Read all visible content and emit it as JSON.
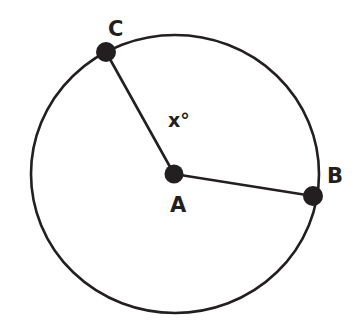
{
  "figure": {
    "background_color": "#ffffff",
    "stroke_color": "#231f20",
    "canvas": {
      "width": 355,
      "height": 329
    }
  },
  "circle": {
    "name": "circle-outline",
    "center_x": 175,
    "center_y": 174,
    "radius_x": 144,
    "radius_y": 139,
    "stroke_width": 2.6,
    "fill": "none"
  },
  "points": [
    {
      "id": "A",
      "label": "A",
      "role": "center",
      "x": 174,
      "y": 174,
      "dot_radius": 9.5,
      "label_x": 170,
      "label_y": 195
    },
    {
      "id": "B",
      "label": "B",
      "role": "on-circle",
      "x": 313,
      "y": 196,
      "dot_radius": 10,
      "label_x": 327,
      "label_y": 166
    },
    {
      "id": "C",
      "label": "C",
      "role": "on-circle",
      "x": 106,
      "y": 52,
      "dot_radius": 10,
      "label_x": 108,
      "label_y": 19
    }
  ],
  "segments": [
    {
      "id": "AC",
      "label": "radius-a-to-c",
      "from": "A",
      "to": "C",
      "x1": 174,
      "y1": 174,
      "x2": 106,
      "y2": 52,
      "stroke_width": 2.6
    },
    {
      "id": "AB",
      "label": "radius-a-to-b",
      "from": "A",
      "to": "B",
      "x1": 174,
      "y1": 174,
      "x2": 313,
      "y2": 196,
      "stroke_width": 2.6
    }
  ],
  "annotations": [
    {
      "id": "angle-CAB",
      "text": "x°",
      "describes": "central angle between radius AC and radius AB",
      "x": 168,
      "y": 111
    }
  ]
}
